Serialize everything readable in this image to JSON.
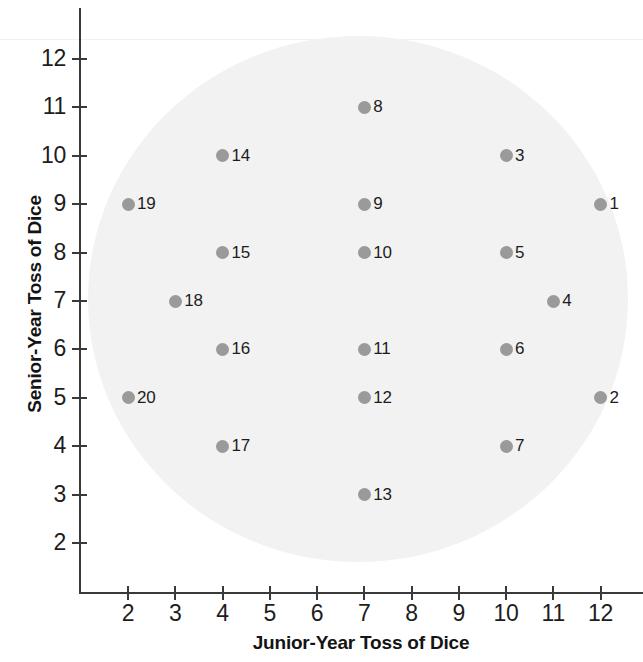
{
  "chart_data": {
    "type": "scatter",
    "title": "",
    "xlabel": "Junior-Year Toss of Dice",
    "ylabel": "Senior-Year Toss of Dice",
    "xlim": [
      1,
      13
    ],
    "ylim": [
      1.2,
      12.8
    ],
    "xticks": [
      2,
      3,
      4,
      5,
      6,
      7,
      8,
      9,
      10,
      11,
      12
    ],
    "yticks": [
      2,
      3,
      4,
      5,
      6,
      7,
      8,
      9,
      10,
      11,
      12
    ],
    "grid": false,
    "legend": null,
    "marker_color": "#9a9a9a",
    "background_shape": "ellipse",
    "background_shape_color": "#f2f2f2",
    "points": [
      {
        "label": "1",
        "x": 12,
        "y": 9
      },
      {
        "label": "2",
        "x": 12,
        "y": 5
      },
      {
        "label": "3",
        "x": 10,
        "y": 10
      },
      {
        "label": "4",
        "x": 11,
        "y": 7
      },
      {
        "label": "5",
        "x": 10,
        "y": 8
      },
      {
        "label": "6",
        "x": 10,
        "y": 6
      },
      {
        "label": "7",
        "x": 10,
        "y": 4
      },
      {
        "label": "8",
        "x": 7,
        "y": 11
      },
      {
        "label": "9",
        "x": 7,
        "y": 9
      },
      {
        "label": "10",
        "x": 7,
        "y": 8
      },
      {
        "label": "11",
        "x": 7,
        "y": 6
      },
      {
        "label": "12",
        "x": 7,
        "y": 5
      },
      {
        "label": "13",
        "x": 7,
        "y": 3
      },
      {
        "label": "14",
        "x": 4,
        "y": 10
      },
      {
        "label": "15",
        "x": 4,
        "y": 8
      },
      {
        "label": "16",
        "x": 4,
        "y": 6
      },
      {
        "label": "17",
        "x": 4,
        "y": 4
      },
      {
        "label": "18",
        "x": 3,
        "y": 7
      },
      {
        "label": "19",
        "x": 2,
        "y": 9
      },
      {
        "label": "20",
        "x": 2,
        "y": 5
      }
    ]
  },
  "axes": {
    "x_title": "Junior-Year Toss of Dice",
    "y_title": "Senior-Year Toss of Dice",
    "x_tick_labels": [
      "2",
      "3",
      "4",
      "5",
      "6",
      "7",
      "8",
      "9",
      "10",
      "11",
      "12"
    ],
    "y_tick_labels": [
      "2",
      "3",
      "4",
      "5",
      "6",
      "7",
      "8",
      "9",
      "10",
      "11",
      "12"
    ]
  },
  "colors": {
    "marker": "#9a9a9a",
    "ellipse": "#f2f2f2",
    "axis": "#3a3a3a",
    "text": "#1d1d1d"
  }
}
